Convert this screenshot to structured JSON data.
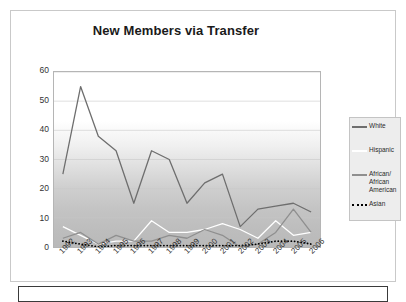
{
  "chart_data": {
    "type": "line",
    "title": "New Members via Transfer",
    "xlabel": "",
    "ylabel": "",
    "ylim": [
      0,
      60
    ],
    "ytick_step": 10,
    "grid": true,
    "legend_position": "right",
    "categories": [
      "1992",
      "1993",
      "1994",
      "1995",
      "1996",
      "1997",
      "1998",
      "1999",
      "2000",
      "2001",
      "2002",
      "2003",
      "2004",
      "2005",
      "2006"
    ],
    "yticks": [
      "0",
      "10",
      "20",
      "30",
      "40",
      "50",
      "60"
    ],
    "series": [
      {
        "name": "White",
        "color": "#6e6e6e",
        "style": "solid",
        "values": [
          25,
          55,
          38,
          33,
          15,
          33,
          30,
          15,
          22,
          25,
          7,
          13,
          14,
          15,
          12
        ]
      },
      {
        "name": "Hispanic",
        "color": "#ffffff",
        "style": "solid",
        "values": [
          7,
          4,
          1,
          2,
          2,
          9,
          5,
          5,
          6,
          8,
          6,
          3,
          9,
          4,
          5
        ]
      },
      {
        "name": "African/\nAfrican\nAmerican",
        "color": "#8f8f8f",
        "style": "solid",
        "values": [
          3,
          5,
          1,
          4,
          2,
          2,
          4,
          3,
          6,
          4,
          0,
          1,
          5,
          13,
          5
        ]
      },
      {
        "name": "Asian",
        "color": "#000000",
        "style": "dotted",
        "values": [
          2,
          1,
          0,
          0.5,
          0.5,
          0.5,
          0.5,
          0.5,
          0.5,
          0.5,
          0.5,
          1,
          2,
          2,
          1
        ]
      }
    ]
  },
  "legend": {
    "items": [
      {
        "label": "White"
      },
      {
        "label": "Hispanic"
      },
      {
        "label": "African/\nAfrican\nAmerican"
      },
      {
        "label": "Asian"
      }
    ]
  }
}
